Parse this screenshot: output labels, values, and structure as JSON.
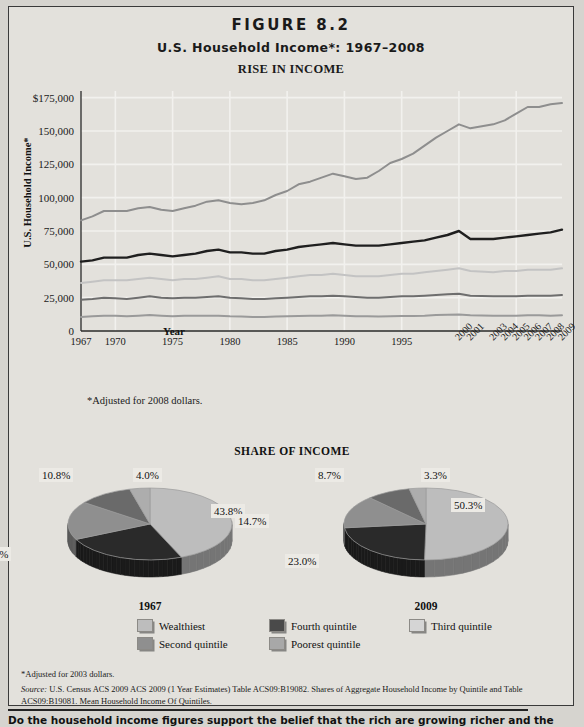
{
  "figure": {
    "number": "FIGURE 8.2",
    "subtitle": "U.S. Household Income*: 1967–2008",
    "section_title": "RISE IN INCOME",
    "share_title": "SHARE OF INCOME",
    "note": "*Adjusted for 2008 dollars.",
    "footnote": "*Adjusted for 2003 dollars.",
    "source_prefix": "Source:",
    "source": " U.S. Census ACS 2009 ACS 2009 (1 Year Estimates) Table ACS09:B19082. Shares of Aggregate Household Income by Quintile and Table ACS09:B19081. Mean Household Income Of Quintiles.",
    "bottom_question": "Do the household income figures support the belief that the rich are growing richer and the poor are"
  },
  "colors": {
    "wealthiest": "#8e8e8e",
    "fourth": "#1f1f1f",
    "third": "#c3c3c3",
    "second": "#6e6e6e",
    "poorest": "#9a9a9a",
    "background": "#e3e1dc",
    "grid": "#f2f1ee",
    "axis": "#2a2a2a",
    "label_box": "#eceae5"
  },
  "chart_data": [
    {
      "type": "line",
      "title": "RISE IN INCOME",
      "xlabel": "Year",
      "ylabel": "U.S. Household Income*",
      "ylim": [
        0,
        180000
      ],
      "yticks": [
        0,
        25000,
        50000,
        75000,
        100000,
        125000,
        150000,
        175000
      ],
      "ytick_labels": [
        "0",
        "25,000",
        "50,000",
        "75,000",
        "100,000",
        "125,000",
        "150,000",
        "$175,000"
      ],
      "xlim": [
        1967,
        2009
      ],
      "xticks_horizontal": [
        "1967",
        "1970",
        "1975",
        "1980",
        "1985",
        "1990",
        "1995"
      ],
      "xticks_rotated": [
        "2000",
        "2001",
        "2003",
        "2004",
        "2005",
        "2006",
        "2007",
        "2008",
        "2009"
      ],
      "grid": true,
      "legend": "below",
      "x": [
        1967,
        1968,
        1969,
        1970,
        1971,
        1972,
        1973,
        1974,
        1975,
        1976,
        1977,
        1978,
        1979,
        1980,
        1981,
        1982,
        1983,
        1984,
        1985,
        1986,
        1987,
        1988,
        1989,
        1990,
        1991,
        1992,
        1993,
        1994,
        1995,
        1996,
        1997,
        1998,
        1999,
        2000,
        2001,
        2003,
        2004,
        2005,
        2006,
        2007,
        2008,
        2009
      ],
      "series": [
        {
          "name": "Wealthiest",
          "color": "#8e8e8e",
          "values": [
            83000,
            86000,
            90000,
            90000,
            90000,
            92000,
            93000,
            91000,
            90000,
            92000,
            94000,
            97000,
            98000,
            96000,
            95000,
            96000,
            98000,
            102000,
            105000,
            110000,
            112000,
            115000,
            118000,
            116000,
            114000,
            115000,
            120000,
            126000,
            129000,
            133000,
            139000,
            145000,
            150000,
            155000,
            152000,
            155000,
            158000,
            163000,
            168000,
            168000,
            170000,
            171000
          ]
        },
        {
          "name": "Fourth quintile",
          "color": "#1f1f1f",
          "values": [
            52000,
            53000,
            55000,
            55000,
            55000,
            57000,
            58000,
            57000,
            56000,
            57000,
            58000,
            60000,
            61000,
            59000,
            59000,
            58000,
            58000,
            60000,
            61000,
            63000,
            64000,
            65000,
            66000,
            65000,
            64000,
            64000,
            64000,
            65000,
            66000,
            67000,
            68000,
            70000,
            72000,
            75000,
            69000,
            69000,
            70000,
            71000,
            72000,
            73000,
            74000,
            76000
          ]
        },
        {
          "name": "Third quintile",
          "color": "#c3c3c3",
          "values": [
            36000,
            37000,
            38000,
            38000,
            38000,
            39000,
            40000,
            39000,
            38000,
            39000,
            39000,
            40000,
            41000,
            39000,
            39000,
            38000,
            38000,
            39000,
            40000,
            41000,
            42000,
            42000,
            43000,
            42000,
            41000,
            41000,
            41000,
            42000,
            43000,
            43000,
            44000,
            45000,
            46000,
            47000,
            45000,
            44000,
            45000,
            45000,
            46000,
            46000,
            46000,
            47000
          ]
        },
        {
          "name": "Second quintile",
          "color": "#6e6e6e",
          "values": [
            23500,
            24000,
            25000,
            24500,
            24000,
            25000,
            26000,
            25000,
            24500,
            25000,
            25000,
            25500,
            26000,
            25000,
            24500,
            24000,
            24000,
            24500,
            25000,
            25500,
            26000,
            26000,
            26500,
            26000,
            25500,
            25000,
            25000,
            25500,
            26000,
            26000,
            26500,
            27000,
            27500,
            28000,
            26500,
            26000,
            26000,
            26000,
            26500,
            26500,
            26500,
            27000
          ]
        },
        {
          "name": "Poorest quintile",
          "color": "#9a9a9a",
          "values": [
            10500,
            11000,
            11500,
            11500,
            11000,
            11500,
            12000,
            11500,
            11000,
            11500,
            11500,
            11500,
            11500,
            11000,
            10800,
            10500,
            10500,
            10800,
            11000,
            11200,
            11500,
            11500,
            11800,
            11500,
            11000,
            11000,
            10800,
            11000,
            11200,
            11300,
            11500,
            12000,
            12200,
            12400,
            11800,
            11500,
            11500,
            11500,
            11800,
            11800,
            11500,
            11800
          ]
        }
      ]
    },
    {
      "type": "pie",
      "title": "1967",
      "labels": [
        "Wealthiest",
        "Second quintile",
        "Third quintile",
        "Fourth quintile",
        "Poorest quintile"
      ],
      "display_labels": [
        "43.8%",
        "24.2%",
        "17.3%",
        "10.8%",
        "4.0%"
      ],
      "values": [
        43.8,
        24.2,
        17.3,
        10.8,
        4.0
      ],
      "colors": [
        "#bdbdbd",
        "#2a2a2a",
        "#8f8f8f",
        "#6a6a6a",
        "#adadad"
      ]
    },
    {
      "type": "pie",
      "title": "2009",
      "labels": [
        "Wealthiest",
        "Second quintile",
        "Third quintile",
        "Fourth quintile",
        "Poorest quintile"
      ],
      "display_labels": [
        "50.3%",
        "23.0%",
        "14.7%",
        "8.7%",
        "3.3%"
      ],
      "values": [
        50.3,
        23.0,
        14.7,
        8.7,
        3.3
      ],
      "colors": [
        "#bdbdbd",
        "#2a2a2a",
        "#8f8f8f",
        "#6a6a6a",
        "#adadad"
      ]
    }
  ],
  "legend": {
    "row1": [
      {
        "label": "Wealthiest",
        "color": "#bdbdbd"
      },
      {
        "label": "Fourth quintile",
        "color": "#4a4a4a"
      },
      {
        "label": "Third quintile",
        "color": "#d5d5d5"
      }
    ],
    "row2": [
      {
        "label": "Second quintile",
        "color": "#8f8f8f"
      },
      {
        "label": "Poorest quintile",
        "color": "#a8a8a8"
      }
    ]
  }
}
